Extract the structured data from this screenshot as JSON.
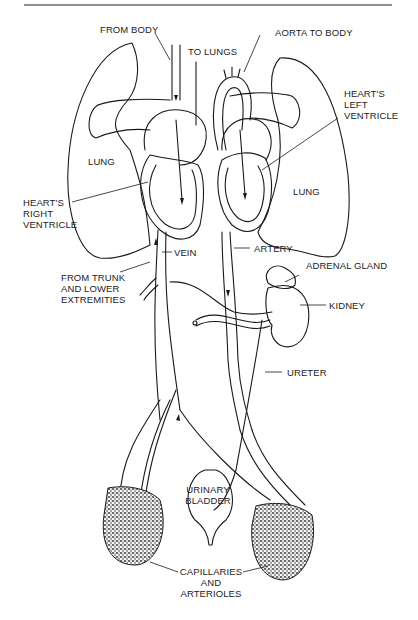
{
  "diagram": {
    "labels": {
      "from_body": "FROM BODY",
      "to_lungs": "TO LUNGS",
      "aorta_to_body": "AORTA TO BODY",
      "hearts_left_ventricle": "HEART'S\nLEFT\nVENTRICLE",
      "lung_left": "LUNG",
      "lung_right": "LUNG",
      "hearts_right_ventricle": "HEART'S\nRIGHT\nVENTRICLE",
      "vein": "VEIN",
      "artery": "ARTERY",
      "from_trunk": "FROM TRUNK\nAND LOWER\nEXTREMITIES",
      "adrenal_gland": "ADRENAL GLAND",
      "kidney": "KIDNEY",
      "ureter": "URETER",
      "urinary_bladder": "URINARY\nBLADDER",
      "capillaries": "CAPILLARIES\nAND\nARTERIOLES"
    },
    "colors": {
      "line": "#1a1a1a",
      "background": "#ffffff",
      "stipple": "#333333"
    }
  }
}
